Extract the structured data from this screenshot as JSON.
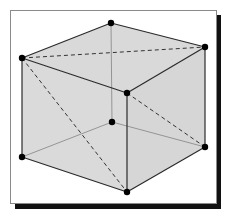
{
  "figure": {
    "title": ""
  },
  "colors": {
    "background": "#ffffff",
    "frame_border": "#8a8a8a",
    "frame_shadow": "#111111",
    "face_top": "#d9d9d9",
    "face_left": "#dadada",
    "face_right": "#d6d6d6",
    "face_bottom": "#e6e6e6",
    "edge_visible": "#2a2a2a",
    "edge_hidden": "#8c8c8c",
    "diagonal_dashed": "#333333",
    "vertex": "#000000"
  },
  "vertices": [
    {
      "id": "top-back",
      "x": 111,
      "y": 23
    },
    {
      "id": "top-right",
      "x": 205,
      "y": 47
    },
    {
      "id": "top-left",
      "x": 22,
      "y": 58
    },
    {
      "id": "top-front",
      "x": 127,
      "y": 93
    },
    {
      "id": "bottom-back",
      "x": 112,
      "y": 122
    },
    {
      "id": "bottom-right",
      "x": 205,
      "y": 147
    },
    {
      "id": "bottom-left",
      "x": 22,
      "y": 157
    },
    {
      "id": "bottom-front",
      "x": 127,
      "y": 192
    }
  ],
  "edges": {
    "visible": [
      [
        "top-left",
        "top-back"
      ],
      [
        "top-back",
        "top-right"
      ],
      [
        "top-left",
        "top-front"
      ],
      [
        "top-front",
        "top-right"
      ],
      [
        "top-left",
        "bottom-left"
      ],
      [
        "top-right",
        "bottom-right"
      ],
      [
        "top-front",
        "bottom-front"
      ],
      [
        "bottom-left",
        "bottom-front"
      ],
      [
        "bottom-front",
        "bottom-right"
      ]
    ],
    "hidden": [
      [
        "top-back",
        "bottom-back"
      ],
      [
        "bottom-back",
        "bottom-left"
      ],
      [
        "bottom-back",
        "bottom-right"
      ]
    ],
    "dashed_diagonals": [
      [
        "top-left",
        "top-right"
      ],
      [
        "top-left",
        "bottom-front"
      ],
      [
        "top-front",
        "bottom-right"
      ]
    ]
  }
}
